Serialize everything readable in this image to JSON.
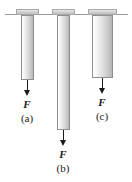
{
  "figure": {
    "background_color": "#ffffff",
    "ceiling": {
      "name": "support-ceiling-line",
      "color": "#9a9a9a",
      "x": 5,
      "y": 14,
      "width": 123
    },
    "rods": [
      {
        "id": "a",
        "part_label": "(a)",
        "force_label": "F",
        "cap": {
          "x": 16,
          "y": 9,
          "width": 23,
          "height": 6
        },
        "body": {
          "x": 21,
          "y": 15,
          "width": 13,
          "height": 65
        },
        "arrow": {
          "x": 27,
          "y": 80,
          "length": 16
        },
        "force_label_pos": {
          "x": 17,
          "y": 97,
          "width": 20
        },
        "part_label_pos": {
          "x": 16,
          "y": 111,
          "width": 22
        }
      },
      {
        "id": "b",
        "part_label": "(b)",
        "force_label": "F",
        "cap": {
          "x": 52,
          "y": 9,
          "width": 23,
          "height": 6
        },
        "body": {
          "x": 57,
          "y": 15,
          "width": 13,
          "height": 115
        },
        "arrow": {
          "x": 63,
          "y": 130,
          "length": 16
        },
        "force_label_pos": {
          "x": 53,
          "y": 147,
          "width": 20
        },
        "part_label_pos": {
          "x": 52,
          "y": 161,
          "width": 22
        }
      },
      {
        "id": "c",
        "part_label": "(c)",
        "force_label": "F",
        "cap": {
          "x": 88,
          "y": 9,
          "width": 29,
          "height": 6
        },
        "body": {
          "x": 92,
          "y": 15,
          "width": 21,
          "height": 63
        },
        "arrow": {
          "x": 102,
          "y": 78,
          "length": 16
        },
        "force_label_pos": {
          "x": 92,
          "y": 95,
          "width": 20
        },
        "part_label_pos": {
          "x": 91,
          "y": 109,
          "width": 22
        }
      }
    ],
    "colors": {
      "rod_outline": "#8e8e8e",
      "rod_light": "#ffffff",
      "rod_dark": "#b6b6b6",
      "cap_fill": "#d2d2d2",
      "arrow": "#1b1b1b",
      "text": "#1b1b1b"
    }
  }
}
